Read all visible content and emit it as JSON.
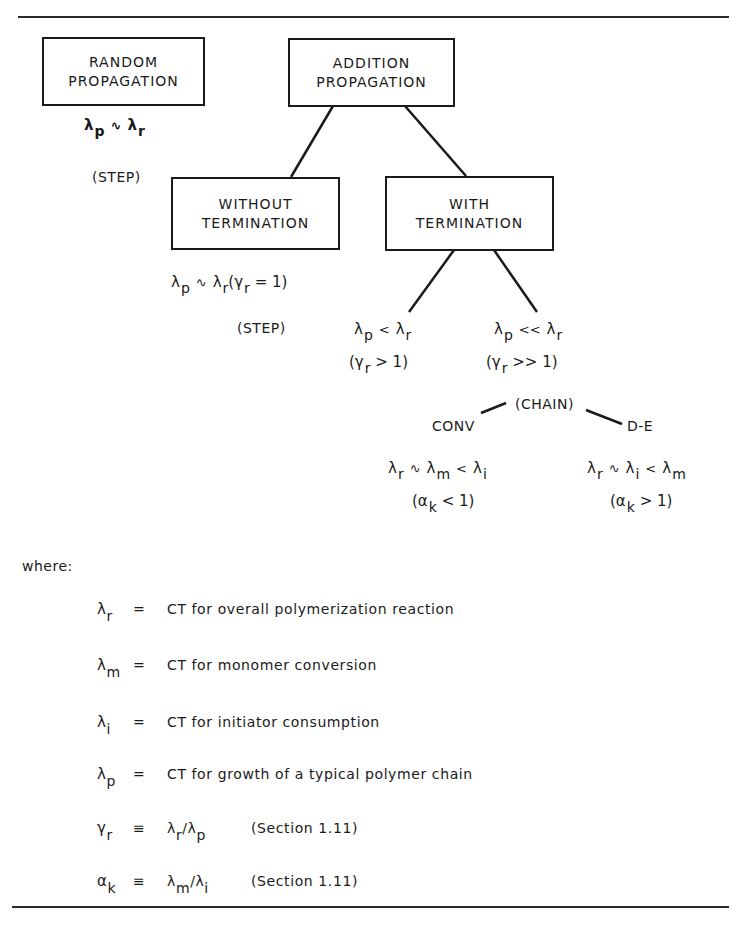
{
  "diagram": {
    "nodes": {
      "random": {
        "line1": "RANDOM",
        "line2": "PROPAGATION"
      },
      "addition": {
        "line1": "ADDITION",
        "line2": "PROPAGATION"
      },
      "without": {
        "line1": "WITHOUT",
        "line2": "TERMINATION"
      },
      "with": {
        "line1": "WITH",
        "line2": "TERMINATION"
      }
    },
    "random_relation": {
      "a": "λ",
      "a_sub": "p",
      "op": "∿",
      "b": "λ",
      "b_sub": "r"
    },
    "random_type": "(STEP)",
    "without_relation": {
      "a": "λ",
      "a_sub": "p",
      "op": "∿",
      "b": "λ",
      "b_sub": "r",
      "paren_open": "(",
      "g": "γ",
      "g_sub": "r",
      "rest": " = 1)"
    },
    "without_type": "(STEP)",
    "with_left": {
      "a": "λ",
      "a_sub": "p",
      "op": "<",
      "b": "λ",
      "b_sub": "r",
      "cond_open": "(γ",
      "cond_sub": "r",
      "cond_rest": " > 1)"
    },
    "with_right": {
      "a": "λ",
      "a_sub": "p",
      "op": "<<",
      "b": "λ",
      "b_sub": "r",
      "cond_open": "(γ",
      "cond_sub": "r",
      "cond_rest": " >> 1)"
    },
    "chain_label": "(CHAIN)",
    "conv_label": "CONV",
    "de_label": "D-E",
    "conv_relation": {
      "a": "λ",
      "a_sub": "r",
      "op1": "∿",
      "b": "λ",
      "b_sub": "m",
      "op2": "<",
      "c": "λ",
      "c_sub": "i"
    },
    "conv_cond": {
      "open": "(α",
      "sub": "k",
      "rest": " < 1)"
    },
    "de_relation": {
      "a": "λ",
      "a_sub": "r",
      "op1": "∿",
      "b": "λ",
      "b_sub": "i",
      "op2": "<",
      "c": "λ",
      "c_sub": "m"
    },
    "de_cond": {
      "open": "(α",
      "sub": "k",
      "rest": " > 1)"
    }
  },
  "legend": {
    "intro": "where:",
    "definitions": [
      {
        "sym": "λ",
        "sub": "r",
        "eq": "=",
        "text": "CT for overall polymerization reaction"
      },
      {
        "sym": "λ",
        "sub": "m",
        "eq": "=",
        "text": "CT for monomer conversion"
      },
      {
        "sym": "λ",
        "sub": "i",
        "eq": "=",
        "text": "CT for initiator consumption"
      },
      {
        "sym": "λ",
        "sub": "p",
        "eq": "=",
        "text": "CT for growth of a typical polymer chain"
      },
      {
        "sym": "γ",
        "sub": "r",
        "eq": "≡",
        "n": "λ",
        "n_sub": "r",
        "slash": "/",
        "d": "λ",
        "d_sub": "p",
        "text": "(Section 1.11)"
      },
      {
        "sym": "α",
        "sub": "k",
        "eq": "≡",
        "n": "λ",
        "n_sub": "m",
        "slash": "/",
        "d": "λ",
        "d_sub": "i",
        "text": "(Section 1.11)"
      }
    ]
  }
}
